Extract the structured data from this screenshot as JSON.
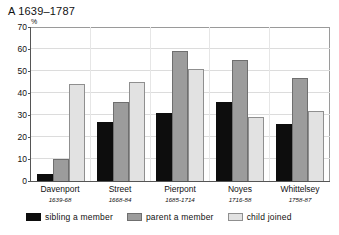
{
  "chart_data": {
    "type": "bar",
    "title": "A 1639–1787",
    "xlabel": "",
    "ylabel": "%",
    "ylim": [
      0,
      70
    ],
    "yticks": [
      0,
      10,
      20,
      30,
      40,
      50,
      60,
      70
    ],
    "grid": true,
    "legend_position": "bottom",
    "categories": [
      "Davenport",
      "Street",
      "Pierpont",
      "Noyes",
      "Whittelsey"
    ],
    "category_subtitles": [
      "1639-68",
      "1668-84",
      "1685-1714",
      "1716-58",
      "1758-87"
    ],
    "series": [
      {
        "name": "sibling a member",
        "color": "#0d0d0d",
        "values": [
          3,
          27,
          31,
          36,
          26
        ]
      },
      {
        "name": "parent a member",
        "color": "#9c9c9c",
        "values": [
          10,
          36,
          59,
          55,
          47
        ]
      },
      {
        "name": "child joined",
        "color": "#e2e2e2",
        "values": [
          44,
          45,
          51,
          29,
          32
        ]
      }
    ]
  },
  "axis": {
    "unit_label": "%"
  }
}
